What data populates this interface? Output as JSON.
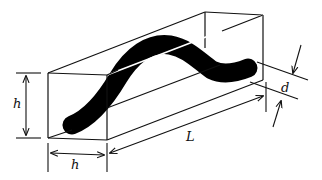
{
  "figure": {
    "colors": {
      "line": "#111111",
      "filament": "#000000",
      "background": "#ffffff"
    },
    "labels": {
      "height": "h",
      "width": "h",
      "length": "L",
      "thickness": "d"
    }
  }
}
